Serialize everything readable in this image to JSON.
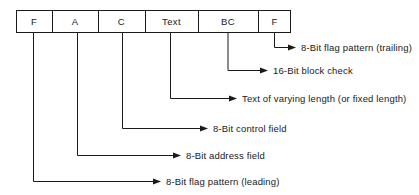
{
  "diagram": {
    "type": "frame-field-diagram",
    "colors": {
      "line": "#1a1a1a",
      "text": "#1a1a1a",
      "background": "#ffffff"
    },
    "frame_fields": [
      {
        "id": "flag-leading",
        "label": "F",
        "x": 16,
        "width": 36
      },
      {
        "id": "address",
        "label": "A",
        "x": 52,
        "width": 46
      },
      {
        "id": "control",
        "label": "C",
        "x": 98,
        "width": 47
      },
      {
        "id": "text",
        "label": "Text",
        "x": 145,
        "width": 53
      },
      {
        "id": "block-check",
        "label": "BC",
        "x": 198,
        "width": 60
      },
      {
        "id": "flag-trailing",
        "label": "F",
        "x": 258,
        "width": 33
      }
    ],
    "callouts": [
      {
        "id": "callout-flag-trailing",
        "field_id": "flag-trailing",
        "label": "8-Bit flag pattern (trailing)",
        "tick_x": 275,
        "elbow_y": 47,
        "arrow_x": 295,
        "text_x": 301
      },
      {
        "id": "callout-block-check",
        "field_id": "block-check",
        "label": "16-Bit block check",
        "tick_x": 228,
        "elbow_y": 70,
        "arrow_x": 267,
        "text_x": 273
      },
      {
        "id": "callout-text",
        "field_id": "text",
        "label": "Text of varying length (or fixed length)",
        "tick_x": 170,
        "elbow_y": 98,
        "arrow_x": 236,
        "text_x": 242
      },
      {
        "id": "callout-control",
        "field_id": "control",
        "label": "8-Bit control field",
        "tick_x": 123,
        "elbow_y": 128,
        "arrow_x": 207,
        "text_x": 213
      },
      {
        "id": "callout-address",
        "field_id": "address",
        "label": "8-Bit address field",
        "tick_x": 78,
        "elbow_y": 155,
        "arrow_x": 180,
        "text_x": 186
      },
      {
        "id": "callout-flag-leading",
        "field_id": "flag-leading",
        "label": "8-Bit flag pattern (leading)",
        "tick_x": 33,
        "elbow_y": 181,
        "arrow_x": 160,
        "text_x": 166
      }
    ],
    "geometry": {
      "box_top": 10,
      "box_bottom": 33,
      "box_left": 16,
      "box_right": 291
    }
  }
}
